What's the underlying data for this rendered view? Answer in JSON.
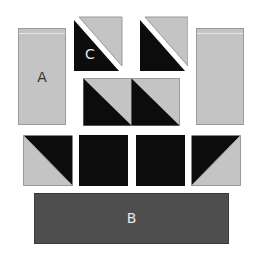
{
  "diagram": {
    "title": "",
    "pieces": {
      "A": {
        "label": "A",
        "color": "#c4c4c4"
      },
      "B": {
        "label": "B",
        "color": "#4e4e4e"
      },
      "C": {
        "label": "C",
        "color": "#0c0c0c"
      },
      "right_rect": {
        "label": "",
        "color": "#c4c4c4"
      }
    },
    "colors": {
      "dark": "#0c0c0c",
      "light": "#c4c4c4",
      "outline": "#8a8a8a",
      "background": "#ffffff"
    },
    "rows": [
      {
        "name": "top",
        "pieces": [
          "A",
          "C-split-square",
          "split-square",
          "right-rect"
        ]
      },
      {
        "name": "middle",
        "pieces": [
          "half-square-triangle",
          "half-square-triangle"
        ]
      },
      {
        "name": "lower",
        "pieces": [
          "hst-light-lower-left",
          "dark-square",
          "dark-square",
          "hst-light-lower-right"
        ]
      },
      {
        "name": "bottom",
        "pieces": [
          "B"
        ]
      }
    ]
  }
}
